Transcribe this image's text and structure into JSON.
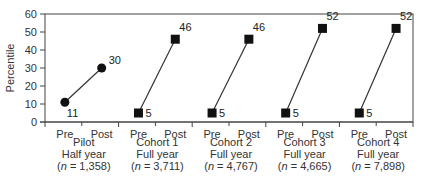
{
  "chart_data": {
    "type": "line",
    "title": "",
    "xlabel": "",
    "ylabel": "Percentile",
    "ylim": [
      0,
      60
    ],
    "yticks": [
      0,
      10,
      20,
      30,
      40,
      50,
      60
    ],
    "grid": false,
    "legend": null,
    "x_sub_labels": [
      "Pre",
      "Post"
    ],
    "groups": [
      {
        "name": "Pilot",
        "duration": "Half year",
        "n_label": "(n = 1,358)",
        "n_italic": "n",
        "n_value": "= 1,358)",
        "marker": "circle",
        "pre": 11,
        "post": 30
      },
      {
        "name": "Cohort 1",
        "duration": "Full year",
        "n_label": "(n = 3,711)",
        "n_italic": "n",
        "n_value": "= 3,711)",
        "marker": "square",
        "pre": 5,
        "post": 46
      },
      {
        "name": "Cohort 2",
        "duration": "Full year",
        "n_label": "(n = 4,767)",
        "n_italic": "n",
        "n_value": "= 4,767)",
        "marker": "square",
        "pre": 5,
        "post": 46
      },
      {
        "name": "Cohort 3",
        "duration": "Full year",
        "n_label": "(n = 4,665)",
        "n_italic": "n",
        "n_value": "= 4,665)",
        "marker": "square",
        "pre": 5,
        "post": 52
      },
      {
        "name": "Cohort 4",
        "duration": "Full year",
        "n_label": "(n = 7,898)",
        "n_italic": "n",
        "n_value": "= 7,898)",
        "marker": "square",
        "pre": 5,
        "post": 52
      }
    ]
  },
  "colors": {
    "axis": "#444444",
    "line": "#333333",
    "marker": "#111111",
    "text": "#333333"
  }
}
